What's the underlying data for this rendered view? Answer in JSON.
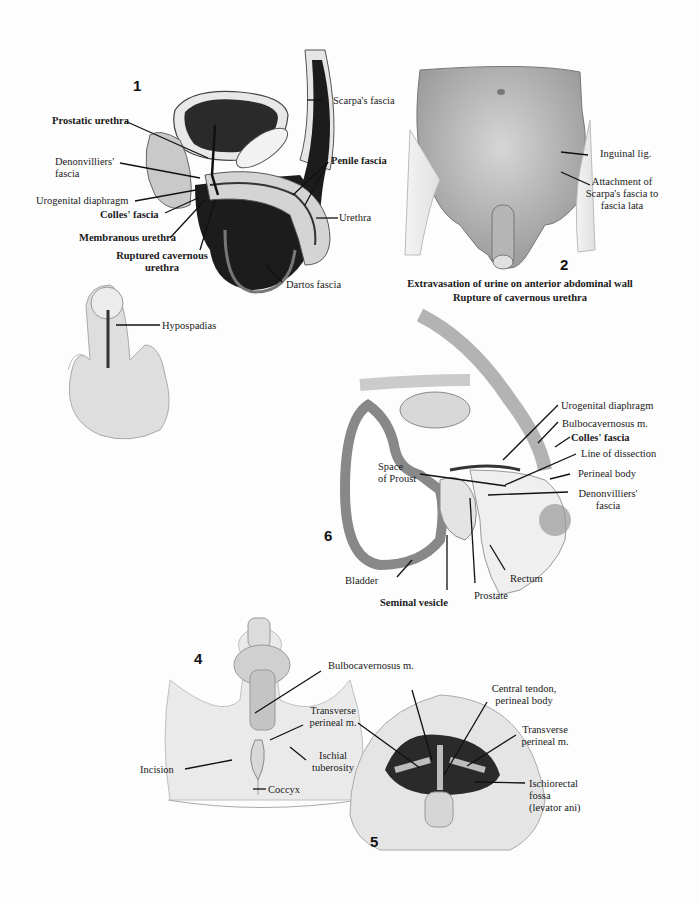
{
  "colors": {
    "background": "#fdfdfd",
    "ink": "#1a1a1a",
    "dark_tissue": "#1c1c1c",
    "mid_tissue": "#8c8c8c",
    "light_tissue": "#d9d9d9",
    "skin": "#c8c8c8"
  },
  "figures": {
    "fig1": {
      "number": "1",
      "labels": {
        "prostatic_urethra": "Prostatic urethra",
        "denonvilliers_fascia": "Denonvilliers'\nfascia",
        "urogenital_diaphragm": "Urogenital diaphragm",
        "colles_fascia": "Colles' fascia",
        "membranous_urethra": "Membranous urethra",
        "ruptured_cavernous_urethra": "Ruptured cavernous\nurethra",
        "scarpas_fascia": "Scarpa's fascia",
        "penile_fascia": "Penile fascia",
        "urethra": "Urethra",
        "dartos_fascia": "Dartos fascia"
      }
    },
    "fig2": {
      "number": "2",
      "labels": {
        "inguinal_lig": "Inguinal lig.",
        "attachment": "Attachment of\nScarpa's fascia to\nfascia lata"
      },
      "caption_line1": "Extravasation of urine on anterior abdominal wall",
      "caption_line2": "Rupture of cavernous urethra"
    },
    "fig3": {
      "labels": {
        "hypospadias": "Hypospadias"
      }
    },
    "fig6": {
      "number": "6",
      "labels": {
        "urogenital_diaphragm": "Urogenital diaphragm",
        "bulbocavernosus": "Bulbocavernosus m.",
        "colles_fascia": "Colles' fascia",
        "line_of_dissection": "Line of  dissection",
        "perineal_body": "Perineal body",
        "denonvilliers_fascia": "Denonvilliers'\nfascia",
        "space_of_proust": "Space\nof Proust",
        "bladder": "Bladder",
        "seminal_vesicle": "Seminal vesicle",
        "prostate": "Prostate",
        "rectum": "Rectum"
      }
    },
    "fig4": {
      "number": "4",
      "labels": {
        "bulbocavernosus": "Bulbocavernosus m.",
        "transverse_perineal": "Transverse\nperineal m.",
        "ischial_tuberosity": "Ischial\ntuberosity",
        "incision": "Incision",
        "coccyx": "Coccyx"
      }
    },
    "fig5": {
      "number": "5",
      "labels": {
        "central_tendon": "Central tendon,\nperineal body",
        "transverse_perineal": "Transverse\nperineal m.",
        "ischiorectal_fossa": "Ischiorectal\nfossa\n(levator ani)"
      }
    }
  }
}
